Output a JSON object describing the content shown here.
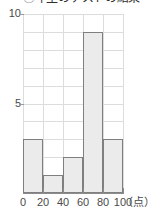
{
  "chart_data": {
    "type": "bar",
    "title": "◯年生のテストの結果",
    "xlabel": "(点)",
    "ylabel": "",
    "categories": [
      "0〜20",
      "20〜40",
      "40〜60",
      "60〜80",
      "80〜100"
    ],
    "bin_edges": [
      0,
      20,
      40,
      60,
      80,
      100
    ],
    "values": [
      3,
      1,
      2,
      9,
      3
    ],
    "ylim": [
      0,
      10
    ],
    "xlim": [
      0,
      100
    ],
    "y_tick_labels": [
      "10",
      "5"
    ],
    "y_tick_values": [
      10,
      5
    ],
    "y_gridline_step": 1,
    "x_tick_labels": [
      "0",
      "20",
      "40",
      "60",
      "80",
      "100"
    ],
    "x_tick_values": [
      0,
      20,
      40,
      60,
      80,
      100
    ],
    "grid": true,
    "legend": false,
    "bar_fill_color": "#ebebeb",
    "bar_border_color": "#7f7f7f",
    "grid_color": "#dcdcdc",
    "axis_color": "#8c8c8c",
    "text_color": "#4a4a4a"
  },
  "axis_unit_label": "（点）"
}
